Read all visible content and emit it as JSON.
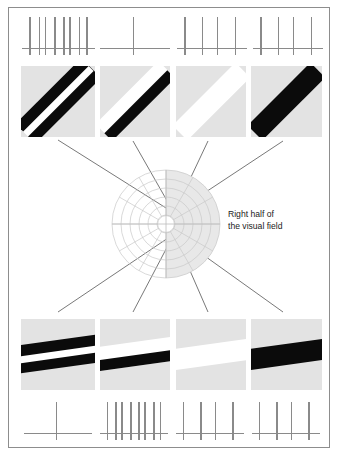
{
  "figure": {
    "caption": "Right half of\nthe visual field",
    "border_color": "#8d8d8d",
    "panel_bg": "#e3e3e3",
    "bar_black": "#0b0b0b",
    "bar_white": "#ffffff",
    "spike_color": "#8a8a8a",
    "ray_color": "#555555",
    "polar_grid_color": "#c9c9c9",
    "polar_shade_color": "#e8e8e8"
  },
  "top_responses": [
    {
      "name": "response-top-1",
      "spike_count": 8,
      "label": "8 spikes"
    },
    {
      "name": "response-top-2",
      "spike_count": 1,
      "label": "1 spike"
    },
    {
      "name": "response-top-3",
      "spike_count": 4,
      "label": "4 spikes"
    },
    {
      "name": "response-top-4",
      "spike_count": 4,
      "label": "4 spikes"
    }
  ],
  "bottom_responses": [
    {
      "name": "response-bottom-1",
      "spike_count": 1,
      "label": "1 spike"
    },
    {
      "name": "response-bottom-2",
      "spike_count": 8,
      "label": "8 spikes"
    },
    {
      "name": "response-bottom-3",
      "spike_count": 4,
      "label": "4 spikes"
    },
    {
      "name": "response-bottom-4",
      "spike_count": 4,
      "label": "4 spikes"
    }
  ],
  "top_stimuli": [
    {
      "name": "stimulus-top-1",
      "description": "two black bars on gray, tilted 45 degrees",
      "orientation_deg": 45,
      "bars": "black-white-black"
    },
    {
      "name": "stimulus-top-2",
      "description": "white bar and black bar on gray, tilted 45 degrees",
      "orientation_deg": 45,
      "bars": "white-black"
    },
    {
      "name": "stimulus-top-3",
      "description": "single white bar on gray, tilted 45 degrees",
      "orientation_deg": 45,
      "bars": "white"
    },
    {
      "name": "stimulus-top-4",
      "description": "single black bar on gray, tilted 45 degrees",
      "orientation_deg": 45,
      "bars": "black"
    }
  ],
  "bottom_stimuli": [
    {
      "name": "stimulus-bottom-1",
      "description": "two black bars on gray, nearly horizontal",
      "orientation_deg": 8,
      "bars": "black-white-black"
    },
    {
      "name": "stimulus-bottom-2",
      "description": "white bar and black bar on gray, nearly horizontal",
      "orientation_deg": 8,
      "bars": "white-black"
    },
    {
      "name": "stimulus-bottom-3",
      "description": "single white bar on gray, nearly horizontal",
      "orientation_deg": 8,
      "bars": "white"
    },
    {
      "name": "stimulus-bottom-4",
      "description": "single black bar on gray, nearly horizontal",
      "orientation_deg": 8,
      "bars": "black"
    }
  ],
  "polar": {
    "name": "visual-field-polar-grid",
    "rings": 6,
    "spokes": 12,
    "shaded_half": "right",
    "upper_focus": {
      "x": 78,
      "y": 45
    },
    "lower_focus": {
      "x": 78,
      "y": 66
    }
  },
  "rays": {
    "top_origin": {
      "x": 174,
      "y": 213
    },
    "bottom_origin": {
      "x": 174,
      "y": 234
    },
    "top_targets": [
      {
        "x": 58,
        "y": 140
      },
      {
        "x": 133,
        "y": 141
      },
      {
        "x": 208,
        "y": 141
      },
      {
        "x": 283,
        "y": 141
      }
    ],
    "bottom_targets": [
      {
        "x": 58,
        "y": 312
      },
      {
        "x": 133,
        "y": 312
      },
      {
        "x": 208,
        "y": 312
      },
      {
        "x": 283,
        "y": 312
      }
    ]
  }
}
